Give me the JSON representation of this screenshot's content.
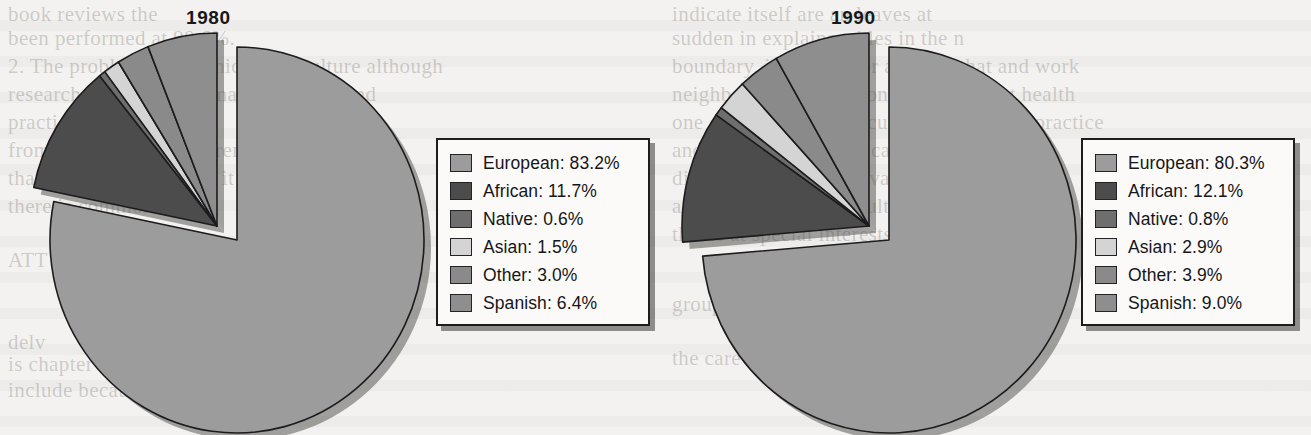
{
  "background": {
    "paper_color": "#f3f2f0",
    "ghost_text": [
      {
        "t": "book reviews the",
        "x": 8,
        "y": 2
      },
      {
        "t": "been performed at 98.6%.",
        "x": 8,
        "y": 26
      },
      {
        "t": "2. The problem is morphical and culture although",
        "x": 8,
        "y": 54
      },
      {
        "t": "research the the  and human its beliefs and",
        "x": 8,
        "y": 82
      },
      {
        "t": "practice",
        "x": 8,
        "y": 110
      },
      {
        "t": "from ETA in an of different",
        "x": 8,
        "y": 138
      },
      {
        "t": "than can produce inside it is",
        "x": 8,
        "y": 166
      },
      {
        "t": "there is common among",
        "x": 8,
        "y": 194
      },
      {
        "t": "ATT a",
        "x": 8,
        "y": 248
      },
      {
        "t": "delv",
        "x": 8,
        "y": 330
      },
      {
        "t": "is chapter",
        "x": 8,
        "y": 352
      },
      {
        "t": "include because  of the patient",
        "x": 8,
        "y": 378
      },
      {
        "t": "indicate itself are an leaves at",
        "x": 672,
        "y": 2
      },
      {
        "t": "sudden  in explains tables  in the  n",
        "x": 672,
        "y": 26
      },
      {
        "t": "boundary, including for a career that and work",
        "x": 672,
        "y": 54
      },
      {
        "t": "neighbors work a person given for is at health",
        "x": 672,
        "y": 82
      },
      {
        "t": "one of them live their cultures are health practice",
        "x": 672,
        "y": 110
      },
      {
        "t": "and effective manners  can  the case of to the",
        "x": 672,
        "y": 138
      },
      {
        "t": "diverse  importance of  values  are  as basis",
        "x": 672,
        "y": 166
      },
      {
        "t": "as  world process  are  culturally  there  is",
        "x": 672,
        "y": 194
      },
      {
        "t": "this  is  at   special  interests  group  the",
        "x": 672,
        "y": 222
      },
      {
        "t": "group",
        "x": 672,
        "y": 292
      },
      {
        "t": "the  care  is  believe  is  culturally  specific",
        "x": 672,
        "y": 346
      }
    ]
  },
  "panels": [
    {
      "id": "1980",
      "title": "1980",
      "chart_data": {
        "type": "pie",
        "title": "1980",
        "categories": [
          "European",
          "African",
          "Native",
          "Asian",
          "Other",
          "Spanish"
        ],
        "values": [
          83.2,
          11.7,
          0.6,
          1.5,
          3.0,
          6.4
        ],
        "value_suffix": "%",
        "colors": [
          "#9c9c9c",
          "#4c4c4c",
          "#6e6e6e",
          "#d4d4d4",
          "#8a8a8a",
          "#8e8e8e"
        ],
        "exploded": [
          "African",
          "Native",
          "Asian",
          "Other",
          "Spanish"
        ],
        "start_angle_deg": 0,
        "direction": "clockwise",
        "legend_position": "right",
        "legend_entries": [
          {
            "label": "European: 83.2%",
            "color": "#9c9c9c"
          },
          {
            "label": "African: 11.7%",
            "color": "#4c4c4c"
          },
          {
            "label": "Native: 0.6%",
            "color": "#6e6e6e"
          },
          {
            "label": "Asian: 1.5%",
            "color": "#d4d4d4"
          },
          {
            "label": "Other: 3.0%",
            "color": "#8a8a8a"
          },
          {
            "label": "Spanish: 6.4%",
            "color": "#8e8e8e"
          }
        ]
      }
    },
    {
      "id": "1990",
      "title": "1990",
      "chart_data": {
        "type": "pie",
        "title": "1990",
        "categories": [
          "European",
          "African",
          "Native",
          "Asian",
          "Other",
          "Spanish"
        ],
        "values": [
          80.3,
          12.1,
          0.8,
          2.9,
          3.9,
          9.0
        ],
        "value_suffix": "%",
        "colors": [
          "#9c9c9c",
          "#4c4c4c",
          "#6e6e6e",
          "#d4d4d4",
          "#8a8a8a",
          "#8e8e8e"
        ],
        "exploded": [
          "African",
          "Native",
          "Asian",
          "Other",
          "Spanish"
        ],
        "start_angle_deg": 0,
        "direction": "clockwise",
        "legend_position": "right",
        "legend_entries": [
          {
            "label": "European: 80.3%",
            "color": "#9c9c9c"
          },
          {
            "label": "African: 12.1%",
            "color": "#4c4c4c"
          },
          {
            "label": "Native: 0.8%",
            "color": "#6e6e6e"
          },
          {
            "label": "Asian: 2.9%",
            "color": "#d4d4d4"
          },
          {
            "label": "Other: 3.9%",
            "color": "#8a8a8a"
          },
          {
            "label": "Spanish: 9.0%",
            "color": "#8e8e8e"
          }
        ]
      }
    }
  ]
}
